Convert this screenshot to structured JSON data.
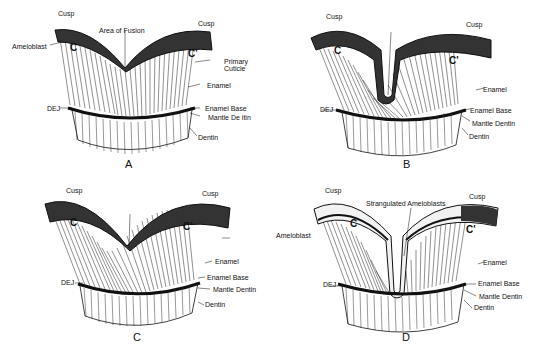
{
  "figure": {
    "panels": [
      {
        "id": "A",
        "letter": "A",
        "cusp_labels": [
          "C",
          "C'"
        ],
        "labels": {
          "cusp_left": "Cusp",
          "cusp_right": "Cusp",
          "center": "Area of Fusion",
          "ameloblast": "Ameloblast",
          "primary_cuticle_1": "Primary",
          "primary_cuticle_2": "Cuticle",
          "enamel": "Enamel",
          "dej": "DEJ",
          "enamel_base": "Enamel Base",
          "mantle_dentin": "Mantle De itin",
          "dentin": "Dentin"
        }
      },
      {
        "id": "B",
        "letter": "B",
        "cusp_labels": [
          "C",
          "C'"
        ],
        "labels": {
          "cusp_left": "Cusp",
          "cusp_right": "Cusp",
          "center_1": "Strangulated",
          "center_2": "Amelo-",
          "center_3": "blasts",
          "ameloblast_1": "Amelo-",
          "ameloblast_2": "blast",
          "primary_cuticle_1": "Primary",
          "primary_cuticle_2": "Cuticle",
          "enamel": "Enamel",
          "dej": "DEJ",
          "enamel_base": "Enamel Base",
          "mantle_dentin": "Mantle Dentin",
          "dentin": "Dentin"
        }
      },
      {
        "id": "C",
        "letter": "C",
        "cusp_labels": [
          "C",
          "C'"
        ],
        "labels": {
          "cusp_left": "Cusp",
          "cusp_right": "Cusp",
          "center": "Strangulated Ameloblasts",
          "ameloblast": "Ameloblast",
          "enamel": "Enamel",
          "dej": "DEJ",
          "enamel_base": "Enamel Base",
          "mantle_dentin": "Mantle Dentin",
          "dentin": "Dentin"
        }
      },
      {
        "id": "D",
        "letter": "D",
        "cusp_labels": [
          "C",
          "C'"
        ],
        "labels": {
          "cusp_left": "Cusp",
          "cusp_right": "Cusp",
          "center": "Strangulated Ameloblasts",
          "ameloblast": "Ameloblast",
          "enamel": "Enamel",
          "dej": "DEJ",
          "enamel_base": "Enamel Base",
          "mantle_dentin": "Mantle Dentin",
          "dentin": "Dentin"
        }
      }
    ]
  }
}
